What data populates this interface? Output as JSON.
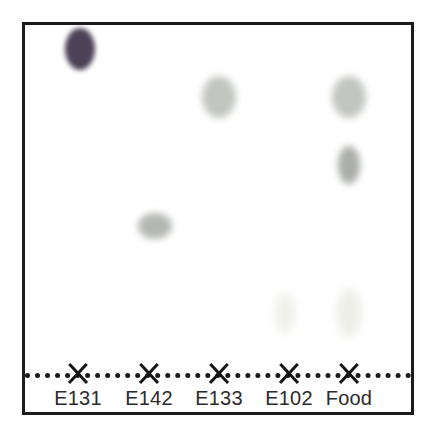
{
  "figure": {
    "kind": "tlc-chromatogram",
    "plate_border_color": "#1b1b1b",
    "background_color": "#ffffff",
    "baseline_color": "#1a1a1a",
    "label_color": "#2b2b2b"
  },
  "axis": {
    "labels": [
      "E131",
      "E142",
      "E133",
      "E102",
      "Food"
    ],
    "tick_marks": [
      "x-mark",
      "x-mark",
      "x-mark",
      "x-mark",
      "x-mark"
    ],
    "baseline_style": "dotted"
  },
  "chart_data": {
    "type": "scatter",
    "title": "",
    "xlabel": "",
    "ylabel": "",
    "categories": [
      "E131",
      "E142",
      "E133",
      "E102",
      "Food"
    ],
    "lane_x": [
      78,
      149,
      219,
      289,
      349
    ],
    "baseline_y": 373,
    "plate_top_y": 25,
    "grid": false,
    "legend": "none",
    "xlim": [
      22,
      414
    ],
    "ylim": [
      415,
      22
    ],
    "spots": [
      {
        "lane": "E131",
        "cx": 80,
        "cy": 49,
        "rx": 15,
        "ry": 21,
        "color": "#4b4258",
        "intensity": "dark",
        "rf": 0.93
      },
      {
        "lane": "E133",
        "cx": 219,
        "cy": 97,
        "rx": 17,
        "ry": 21,
        "color": "#c3c6c0",
        "intensity": "medium",
        "rf": 0.79
      },
      {
        "lane": "E142",
        "cx": 155,
        "cy": 226,
        "rx": 17,
        "ry": 13,
        "color": "#b4b7b2",
        "intensity": "medium",
        "rf": 0.42
      },
      {
        "lane": "E102",
        "cx": 285,
        "cy": 313,
        "rx": 10,
        "ry": 21,
        "color": "#eff0ea",
        "intensity": "faint",
        "rf": 0.17
      },
      {
        "lane": "Food",
        "cx": 349,
        "cy": 97,
        "rx": 17,
        "ry": 21,
        "color": "#c3c6c0",
        "intensity": "medium",
        "rf": 0.79
      },
      {
        "lane": "Food",
        "cx": 349,
        "cy": 165,
        "rx": 11,
        "ry": 19,
        "color": "#aaada8",
        "intensity": "medium-dark",
        "rf": 0.6
      },
      {
        "lane": "Food",
        "cx": 349,
        "cy": 313,
        "rx": 12,
        "ry": 25,
        "color": "#eceee7",
        "intensity": "faint",
        "rf": 0.17
      }
    ]
  }
}
